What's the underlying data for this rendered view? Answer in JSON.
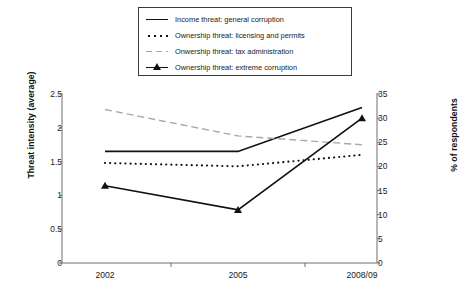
{
  "chart_data": {
    "type": "line",
    "title": "",
    "xlabel": "",
    "ylabel": "Threat intensity (average)",
    "y2label": "% of respondents",
    "categories": [
      "2002",
      "2005",
      "2008/09"
    ],
    "ylim": [
      0,
      2.5
    ],
    "y2lim": [
      0,
      35
    ],
    "yticks": [
      "0",
      "0.5",
      "1",
      "1.5",
      "2",
      "2.5"
    ],
    "ytick_values": [
      0,
      0.5,
      1,
      1.5,
      2,
      2.5
    ],
    "y2ticks": [
      "0",
      "5",
      "10",
      "15",
      "20",
      "25",
      "30",
      "35"
    ],
    "y2tick_values": [
      0,
      5,
      10,
      15,
      20,
      25,
      30,
      35
    ],
    "grid": false,
    "legend_position": "top",
    "series": [
      {
        "name": "Income threat: general corruption",
        "style": "solid",
        "color": "#111111",
        "axis": "left",
        "marker": "none",
        "values": [
          1.65,
          1.65,
          2.3
        ]
      },
      {
        "name": "Ownership threat: licensing and permits",
        "style": "dotted",
        "color": "#111111",
        "axis": "left",
        "marker": "none",
        "values": [
          1.48,
          1.43,
          1.6
        ]
      },
      {
        "name": "Onwership threat: tax administration",
        "style": "dashed",
        "color": "#a8a8a8",
        "axis": "left",
        "marker": "none",
        "values": [
          2.27,
          1.88,
          1.75
        ]
      },
      {
        "name": "Ownership threat: extreme corruption",
        "style": "solid-marker",
        "color": "#111111",
        "axis": "right",
        "marker": "triangle",
        "values": [
          16.0,
          11.0,
          30.0
        ]
      }
    ]
  },
  "legend": {
    "items": [
      {
        "label": "Income threat: general corruption",
        "key": "line-solid-icon"
      },
      {
        "label": "Ownership threat: licensing and permits",
        "key": "line-dotted-icon"
      },
      {
        "label": "Onwership threat: tax administration",
        "key": "line-dashed-icon"
      },
      {
        "label": "Ownership threat: extreme corruption",
        "key": "line-marker-icon"
      }
    ]
  },
  "axes": {
    "left_title": "Threat intensity (average)",
    "right_title": "% of respondents",
    "x_labels": [
      "2002",
      "2005",
      "2008/09"
    ],
    "left_ticks": [
      "2.5",
      "2",
      "1.5",
      "1",
      "0.5",
      "0"
    ],
    "right_ticks": [
      "35",
      "30",
      "25",
      "20",
      "15",
      "10",
      "5",
      "0"
    ]
  }
}
